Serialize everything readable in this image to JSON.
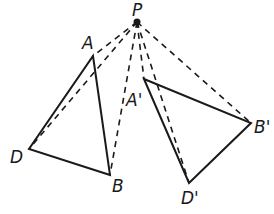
{
  "diagram": {
    "center": {
      "label": "P",
      "x": 137,
      "y": 22,
      "label_x": 132,
      "label_y": 16
    },
    "original_triangle": {
      "vertices": [
        {
          "label": "A",
          "x": 93,
          "y": 56,
          "label_x": 82,
          "label_y": 49
        },
        {
          "label": "B",
          "x": 110,
          "y": 175,
          "label_x": 112,
          "label_y": 192
        },
        {
          "label": "D",
          "x": 29,
          "y": 149,
          "label_x": 10,
          "label_y": 163
        }
      ]
    },
    "image_triangle": {
      "vertices": [
        {
          "label": "A'",
          "x": 144,
          "y": 79,
          "label_x": 126,
          "label_y": 106
        },
        {
          "label": "B'",
          "x": 251,
          "y": 123,
          "label_x": 254,
          "label_y": 133
        },
        {
          "label": "D'",
          "x": 189,
          "y": 183,
          "label_x": 181,
          "label_y": 204
        }
      ]
    },
    "dashed_segments": [
      "PA",
      "PD",
      "PB",
      "PA'",
      "PD'",
      "PB'"
    ],
    "colors": {
      "line": "#1a1a1a",
      "background": "#ffffff"
    }
  }
}
